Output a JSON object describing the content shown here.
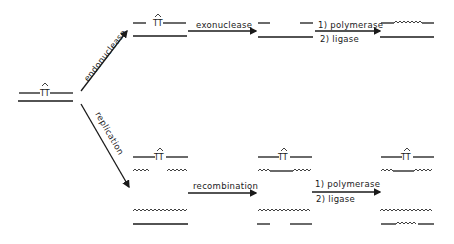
{
  "diagram": {
    "type": "DNA repair pathways schematic",
    "colors": {
      "ink": "#1a1a1a",
      "background": "#ffffff"
    },
    "dimer_label": "TT",
    "start": {
      "name": "damaged-duplex",
      "dimer": "TT"
    },
    "pathways": [
      {
        "name": "excision-repair",
        "branch_label": "endonuclease",
        "steps": [
          {
            "label": "exonuclease"
          },
          {
            "label_1": "1) polymerase",
            "label_2": "2) ligase"
          }
        ]
      },
      {
        "name": "recombination-repair",
        "branch_label": "replication",
        "steps": [
          {
            "label": "recombination"
          },
          {
            "label_1": "1) polymerase",
            "label_2": "2) ligase"
          }
        ]
      }
    ]
  }
}
